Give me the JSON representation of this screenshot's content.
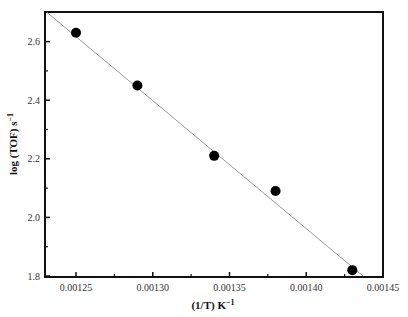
{
  "chart_data": {
    "type": "scatter",
    "title": "",
    "xlabel": "(1/T) K",
    "xlabel_sup": "−1",
    "ylabel": "log (TOF) s",
    "ylabel_sup": "−1",
    "xlim": [
      0.00123,
      0.00145
    ],
    "ylim": [
      1.8,
      2.7
    ],
    "x_ticks": [
      "0.00125",
      "0.00130",
      "0.00135",
      "0.00140",
      "0.00145"
    ],
    "y_ticks": [
      "1.8",
      "2.0",
      "2.2",
      "2.4",
      "2.6"
    ],
    "grid": false,
    "legend": null,
    "series": [
      {
        "name": "data",
        "marker": "filled-circle",
        "x": [
          0.00125,
          0.00129,
          0.00134,
          0.00138,
          0.00143
        ],
        "y": [
          2.63,
          2.45,
          2.21,
          2.09,
          1.82
        ]
      },
      {
        "name": "linear fit",
        "type": "line",
        "x": [
          0.001231,
          0.001437
        ],
        "y": [
          2.7,
          1.8
        ]
      }
    ]
  }
}
